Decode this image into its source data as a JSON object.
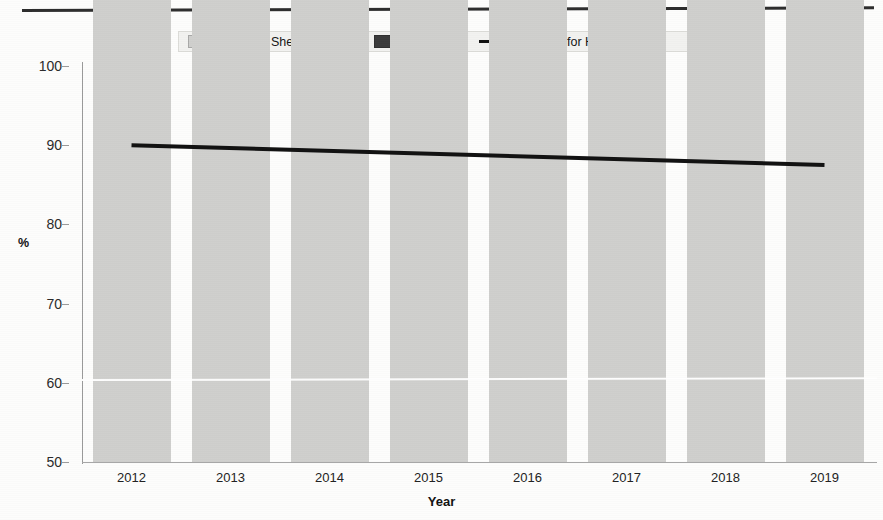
{
  "figure": {
    "background": "#fdfdfc",
    "has_top_rule": true
  },
  "legend": {
    "position": "top-center",
    "items": [
      {
        "label": "He",
        "color": "#cfcfcd",
        "marker": "swatch"
      },
      {
        "label": "She",
        "color": "#a9a9a7",
        "marker": "swatch"
      },
      {
        "label": "They",
        "color": "#8d8d8b",
        "marker": "swatch"
      },
      {
        "label": "Unavailable",
        "color": "#3b3b3b",
        "marker": "swatch"
      },
      {
        "label": "Trend line for He",
        "color": "#111111",
        "marker": "line"
      }
    ]
  },
  "axes": {
    "y_title": "%",
    "x_title": "Year",
    "y_ticks": [
      "100",
      "90",
      "80",
      "70",
      "60",
      "50"
    ],
    "x_ticks": [
      "2012",
      "2013",
      "2014",
      "2015",
      "2016",
      "2017",
      "2018",
      "2019"
    ]
  },
  "chart_data": {
    "type": "bar",
    "title": "",
    "subtitle": "",
    "xlabel": "Year",
    "ylabel": "%",
    "ylim": [
      50,
      100
    ],
    "ytick_values": [
      50,
      60,
      70,
      80,
      90,
      100
    ],
    "grid": false,
    "stacked": true,
    "legend_position": "top-center",
    "categories": [
      "2012",
      "2013",
      "2014",
      "2015",
      "2016",
      "2017",
      "2018",
      "2019"
    ],
    "series": [
      {
        "name": "He",
        "color": "#cfcfcd",
        "values": [
          85.8,
          90.2,
          93.4,
          88.2,
          91.2,
          92.4,
          81.8,
          87.2
        ]
      },
      {
        "name": "She",
        "color": "#a9a9a7",
        "values": [
          0.0,
          0.0,
          0.0,
          0.0,
          0.0,
          0.0,
          0.0,
          0.0
        ]
      },
      {
        "name": "They",
        "color": "#8d8d8b",
        "values": [
          11.3,
          6.8,
          4.2,
          11.8,
          6.0,
          6.9,
          14.7,
          11.3
        ]
      },
      {
        "name": "Unavailable",
        "color": "#3b3b3b",
        "values": [
          2.9,
          3.0,
          2.4,
          0.0,
          2.8,
          0.7,
          3.5,
          1.5
        ]
      }
    ],
    "annotations": [
      {
        "type": "trendline",
        "label": "Trend line for He",
        "color": "#111111",
        "x_start": "2012",
        "x_end": "2019",
        "y_start": 90.0,
        "y_end": 87.5
      }
    ]
  }
}
